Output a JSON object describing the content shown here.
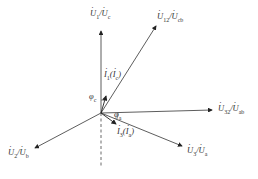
{
  "diagram": {
    "type": "phasor-diagram",
    "origin": {
      "x": 101,
      "y": 113
    },
    "vectors": [
      {
        "id": "U1",
        "label_main": "U",
        "sub1": "1",
        "sep": "/",
        "label_alt": "U",
        "sub2": "c",
        "tip": {
          "x": 101,
          "y": 30
        }
      },
      {
        "id": "U12",
        "label_main": "U",
        "sub1": "12",
        "sep": "/",
        "label_alt": "U",
        "sub2": "cb",
        "tip": {
          "x": 156,
          "y": 25
        }
      },
      {
        "id": "U32",
        "label_main": "U",
        "sub1": "32",
        "sep": "/",
        "label_alt": "U",
        "sub2": "ab",
        "tip": {
          "x": 213,
          "y": 110
        }
      },
      {
        "id": "U3",
        "label_main": "U",
        "sub1": "3",
        "sep": "/",
        "label_alt": "U",
        "sub2": "a",
        "tip": {
          "x": 183,
          "y": 146
        }
      },
      {
        "id": "U2",
        "label_main": "U",
        "sub1": "2",
        "sep": "/",
        "label_alt": "U",
        "sub2": "b",
        "tip": {
          "x": 34,
          "y": 148
        }
      },
      {
        "id": "I1",
        "label_main": "I",
        "sub1": "1",
        "label_alt": "I",
        "sub2": "c",
        "tip": {
          "x": 106,
          "y": 95
        }
      },
      {
        "id": "I3",
        "label_main": "I",
        "sub1": "3",
        "label_alt": "I",
        "sub2": "a",
        "tip": {
          "x": 116,
          "y": 125
        }
      }
    ],
    "angles": [
      {
        "symbol": "φ",
        "sub": "c"
      },
      {
        "symbol": "φ",
        "sub": "a"
      }
    ],
    "reference_line": "dashed vertical below origin"
  }
}
